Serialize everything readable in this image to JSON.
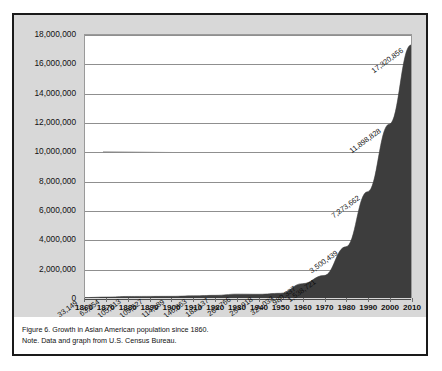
{
  "figure": {
    "caption": "Figure 6. Growth in Asian American population since 1860.",
    "note": "Note. Data and graph from U.S. Census Bureau."
  },
  "colors": {
    "area_fill": "#3d3d3d",
    "panel_background": "#d8d8d8",
    "plot_background": "#ffffff",
    "gridline": "#8f8f8f",
    "frame_border": "#1a1a1a",
    "text": "#111111"
  },
  "chart_data": {
    "type": "area",
    "title": "",
    "xlabel": "",
    "ylabel": "",
    "grid": true,
    "legend": "none",
    "xlim": [
      1860,
      2010
    ],
    "ylim": [
      0,
      18000000
    ],
    "x": [
      1860,
      1870,
      1880,
      1890,
      1900,
      1910,
      1920,
      1930,
      1940,
      1950,
      1960,
      1970,
      1980,
      1990,
      2000,
      2010
    ],
    "categories": [
      "1860",
      "1870",
      "1880",
      "1890",
      "1900",
      "1910",
      "1920",
      "1930",
      "1940",
      "1950",
      "1960",
      "1970",
      "1980",
      "1990",
      "2000",
      "2010"
    ],
    "values": [
      33149,
      63254,
      105613,
      109527,
      114189,
      146863,
      182137,
      264766,
      254918,
      321033,
      980337,
      1538721,
      3500439,
      7273662,
      11898828,
      17320856
    ],
    "point_labels": [
      "33,149",
      "63,254",
      "105,613",
      "109,527",
      "114,189",
      "146,863",
      "182,137",
      "264,766",
      "254,918",
      "321,033",
      "980,337",
      "1,538,721",
      "3,500,439",
      "7,273,662",
      "11,898,828",
      "17,320,856"
    ],
    "y_ticks": [
      0,
      2000000,
      4000000,
      6000000,
      8000000,
      10000000,
      12000000,
      14000000,
      16000000,
      18000000
    ],
    "y_tick_labels": [
      "0",
      "2,000,000",
      "4,000,000",
      "6,000,000",
      "8,000,000",
      "10,000,000",
      "12,000,000",
      "14,000,000",
      "16,000,000",
      "18,000,000"
    ]
  }
}
